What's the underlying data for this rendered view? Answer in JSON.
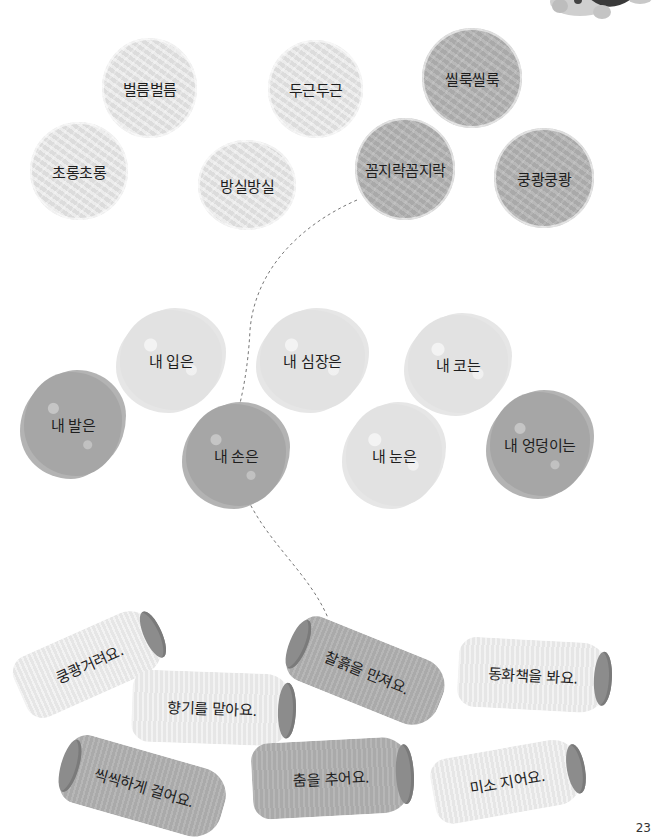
{
  "yarn_balls": [
    {
      "label": "벌름벌름",
      "tone": "light"
    },
    {
      "label": "두근두근",
      "tone": "light"
    },
    {
      "label": "씰룩씰룩",
      "tone": "dark"
    },
    {
      "label": "초롱초롱",
      "tone": "light"
    },
    {
      "label": "방실방실",
      "tone": "light"
    },
    {
      "label": "꼼지락꼼지락",
      "tone": "dark"
    },
    {
      "label": "쿵쾅쿵쾅",
      "tone": "dark"
    }
  ],
  "scribbles": [
    {
      "label": "내 입은",
      "tone": "light"
    },
    {
      "label": "내 심장은",
      "tone": "light"
    },
    {
      "label": "내 코는",
      "tone": "light"
    },
    {
      "label": "내 발은",
      "tone": "dark"
    },
    {
      "label": "내 손은",
      "tone": "dark"
    },
    {
      "label": "내 눈은",
      "tone": "light"
    },
    {
      "label": "내 엉덩이는",
      "tone": "dark"
    }
  ],
  "spools": [
    {
      "label": "쿵쾅거려요.",
      "tone": "light"
    },
    {
      "label": "찰흙을 만져요.",
      "tone": "dark"
    },
    {
      "label": "동화책을 봐요.",
      "tone": "light"
    },
    {
      "label": "향기를 맡아요.",
      "tone": "light"
    },
    {
      "label": "씩씩하게 걸어요.",
      "tone": "dark"
    },
    {
      "label": "춤을 추어요.",
      "tone": "dark"
    },
    {
      "label": "미소 지어요.",
      "tone": "light"
    }
  ],
  "connection_example": {
    "from": "꼼지락꼼지락",
    "via": "내 손은",
    "to": "찰흙을 만져요."
  },
  "page_number": "23"
}
